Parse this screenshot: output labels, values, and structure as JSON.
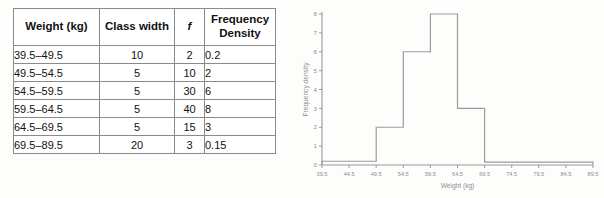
{
  "table": {
    "headers": [
      "Weight (kg)",
      "Class width",
      "f",
      "Frequency Density"
    ],
    "header_fd_line1": "Frequency",
    "header_fd_line2": "Density",
    "rows": [
      {
        "weight": "39.5–49.5",
        "class_width": "10",
        "f": "2",
        "freq_density": "0.2"
      },
      {
        "weight": "49.5–54.5",
        "class_width": "5",
        "f": "10",
        "freq_density": "2"
      },
      {
        "weight": "54.5–59.5",
        "class_width": "5",
        "f": "30",
        "freq_density": "6"
      },
      {
        "weight": "59.5–64.5",
        "class_width": "5",
        "f": "40",
        "freq_density": "8"
      },
      {
        "weight": "64.5–69.5",
        "class_width": "5",
        "f": "15",
        "freq_density": "3"
      },
      {
        "weight": "69.5–89.5",
        "class_width": "20",
        "f": "3",
        "freq_density": "0.15"
      }
    ]
  },
  "chart_data": {
    "type": "bar",
    "title": "",
    "xlabel": "Weight (kg)",
    "ylabel": "Frequency density",
    "xlim": [
      39.5,
      89.5
    ],
    "ylim": [
      0,
      8
    ],
    "grid": false,
    "legend": null,
    "xticks": [
      "39.5",
      "44.5",
      "49.5",
      "54.5",
      "59.5",
      "64.5",
      "69.5",
      "74.5",
      "79.5",
      "84.5",
      "89.5"
    ],
    "xtick_values": [
      39.5,
      44.5,
      49.5,
      54.5,
      59.5,
      64.5,
      69.5,
      74.5,
      79.5,
      84.5,
      89.5
    ],
    "yticks": [
      "0",
      "1",
      "2",
      "3",
      "4",
      "5",
      "6",
      "7",
      "8"
    ],
    "ytick_values": [
      0,
      1,
      2,
      3,
      4,
      5,
      6,
      7,
      8
    ],
    "bins": [
      {
        "x0": 39.5,
        "x1": 49.5,
        "value": 0.2
      },
      {
        "x0": 49.5,
        "x1": 54.5,
        "value": 2
      },
      {
        "x0": 54.5,
        "x1": 59.5,
        "value": 6
      },
      {
        "x0": 59.5,
        "x1": 64.5,
        "value": 8
      },
      {
        "x0": 64.5,
        "x1": 69.5,
        "value": 3
      },
      {
        "x0": 69.5,
        "x1": 89.5,
        "value": 0.15
      }
    ],
    "colors": {
      "bar_stroke": "#9c9c9c",
      "axis": "#9a9a9a",
      "text": "#8d8d8d"
    }
  }
}
